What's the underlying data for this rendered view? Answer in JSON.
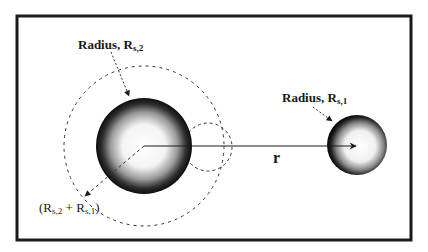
{
  "diagram": {
    "labels": {
      "radius_large": {
        "prefix": "Radius, R",
        "sub": "s,2"
      },
      "radius_small": {
        "prefix": "Radius, R",
        "sub": "s,1"
      },
      "sum": {
        "open": "(R",
        "sub1": "s,2",
        "plus": " + R",
        "sub2": "s,1",
        "close": ")"
      },
      "distance": "r"
    },
    "elements": {
      "frame": {
        "x": 17,
        "y": 16,
        "width": 394,
        "height": 224,
        "stroke": "#1a1a1a"
      },
      "large_sphere": {
        "cx": 144,
        "cy": 146,
        "r": 48
      },
      "small_sphere": {
        "cx": 357,
        "cy": 145,
        "r": 30
      },
      "collision_circle": {
        "cx": 144,
        "cy": 146,
        "r": 80,
        "style": "dashed"
      },
      "ghost_small_sphere": {
        "cx": 208,
        "cy": 147,
        "r": 24,
        "style": "dashed"
      },
      "distance_arrow": {
        "x1": 144,
        "y1": 146,
        "x2": 356,
        "y2": 146
      }
    },
    "colors": {
      "ink": "#1a1a1a",
      "background": "#ffffff"
    }
  }
}
